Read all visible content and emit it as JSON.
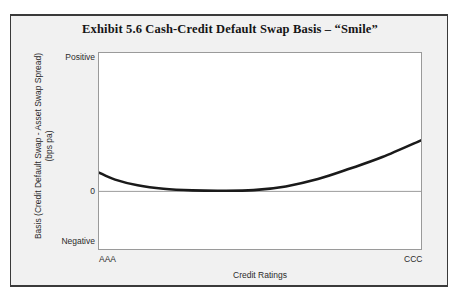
{
  "chart_data": {
    "type": "line",
    "title": "Exhibit 5.6   Cash-Credit Default Swap Basis – “Smile”",
    "xlabel": "Credit Ratings",
    "ylabel_line1": "Basis (Credit Default Swap - Asset Swap Spread)",
    "ylabel_line2": "(bps pa)",
    "x_tick_labels": [
      "AAA",
      "CCC"
    ],
    "y_tick_labels": [
      "Positive",
      "0",
      "Negative"
    ],
    "xlim": [
      "AAA",
      "CCC"
    ],
    "ylim": [
      "Negative",
      "Positive"
    ],
    "grid": false,
    "legend": "none",
    "zero_line": 0,
    "series": [
      {
        "name": "Cash-CDS Basis Smile",
        "color": "#1a1a1a",
        "line_width": 2.6,
        "x": [
          0,
          5,
          12,
          20,
          29,
          38,
          48,
          58,
          68,
          78,
          88,
          100
        ],
        "y": [
          13.6,
          8.5,
          4.4,
          1.9,
          0.7,
          0.4,
          0.9,
          3.6,
          8.9,
          16.5,
          24.8,
          36.9
        ],
        "x_units": "percent of axis from AAA (0) to CCC (100)",
        "y_units": "percent of axis above the 0 line (0 = zero basis line, 100 = Positive top)",
        "description": "Basis starts positive at AAA, declines to a near-zero minimum around single-A/BBB, then rises steadily and steeply into high yield towards CCC, forming a smile."
      }
    ],
    "annotations": []
  }
}
